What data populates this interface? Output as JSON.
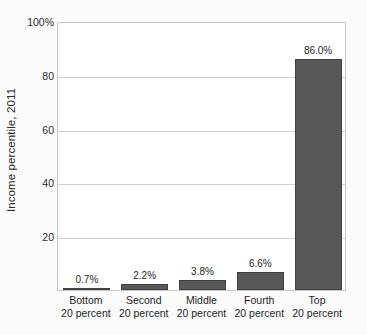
{
  "chart_data": {
    "type": "bar",
    "title": "",
    "subtitle": "",
    "xlabel": "",
    "ylabel": "Income percentile, 2011",
    "ylim": [
      0,
      100
    ],
    "yticks": [
      0,
      20,
      40,
      60,
      80,
      100
    ],
    "ytick_labels": [
      "",
      "20",
      "40",
      "60",
      "80",
      "100%"
    ],
    "grid": true,
    "legend": null,
    "categories": [
      "Bottom 20 percent",
      "Second 20 percent",
      "Middle 20 percent",
      "Fourth 20 percent",
      "Top 20 percent"
    ],
    "category_lines": [
      {
        "line1": "Bottom",
        "line2": "20 percent"
      },
      {
        "line1": "Second",
        "line2": "20 percent"
      },
      {
        "line1": "Middle",
        "line2": "20 percent"
      },
      {
        "line1": "Fourth",
        "line2": "20 percent"
      },
      {
        "line1": "Top",
        "line2": "20 percent"
      }
    ],
    "values": [
      0.7,
      2.2,
      3.8,
      6.6,
      86.0
    ],
    "value_labels": [
      "0.7%",
      "2.2%",
      "3.8%",
      "6.6%",
      "86.0%"
    ],
    "bar_color": "#585858",
    "bar_edge_color": "#3f3f3f",
    "grid_color": "#d0d0d0",
    "axis_color": "#c9c9c9",
    "background_color": "#ffffff",
    "figure_background_color": "#fbfbfb",
    "text_color": "#1f1f1f"
  }
}
